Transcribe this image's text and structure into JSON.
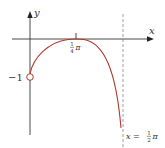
{
  "figure": {
    "x_axis_label": "x",
    "y_axis_label": "y",
    "tick_x_label": {
      "num": "1",
      "den": "4",
      "sym": "π"
    },
    "y_intercept_label": "−1",
    "asymptote_label": {
      "prefix": "x = ",
      "num": "1",
      "den": "2",
      "sym": "π"
    },
    "curve_color": "#b03a2e",
    "axis_color": "#333333",
    "asymptote_color": "#777777"
  }
}
